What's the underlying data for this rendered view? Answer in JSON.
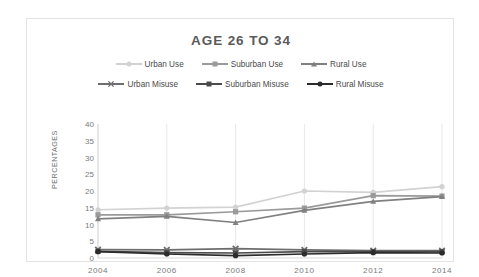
{
  "chart_data": {
    "type": "line",
    "title": "AGE 26 TO 34",
    "xlabel": "",
    "ylabel": "PERCENTAGES",
    "x": [
      2004,
      2006,
      2008,
      2010,
      2012,
      2014
    ],
    "xtick_labels": [
      "2004",
      "2006",
      "2008",
      "2010",
      "2012",
      "2014"
    ],
    "ytick_labels": [
      "0",
      "5",
      "10",
      "15",
      "20",
      "25",
      "30",
      "35",
      "40"
    ],
    "yticks": [
      0,
      5,
      10,
      15,
      20,
      25,
      30,
      35,
      40
    ],
    "ylim": [
      0,
      40
    ],
    "grid": "vertical-only",
    "legend_position": "top-center",
    "series": [
      {
        "name": "Urban Use",
        "color": "#d2d2d2",
        "marker": "circle",
        "values": [
          14.4,
          14.9,
          15.2,
          20.0,
          19.6,
          21.3
        ]
      },
      {
        "name": "Suburban Use",
        "color": "#9a9a9a",
        "marker": "square",
        "values": [
          12.9,
          12.9,
          13.8,
          14.9,
          18.6,
          18.5
        ]
      },
      {
        "name": "Rural Use",
        "color": "#808080",
        "marker": "triangle",
        "values": [
          11.7,
          12.4,
          10.6,
          14.2,
          16.9,
          18.3
        ]
      },
      {
        "name": "Urban Misuse",
        "color": "#6e6e6e",
        "marker": "x",
        "values": [
          2.5,
          2.4,
          2.8,
          2.4,
          2.2,
          2.2
        ]
      },
      {
        "name": "Suburban Misuse",
        "color": "#4a4a4a",
        "marker": "square",
        "values": [
          2.0,
          1.6,
          1.5,
          1.9,
          1.9,
          1.9
        ]
      },
      {
        "name": "Rural Misuse",
        "color": "#2b2b2b",
        "marker": "circle",
        "values": [
          1.9,
          1.2,
          0.7,
          1.2,
          1.6,
          1.5
        ]
      }
    ]
  },
  "legend": {
    "rows": [
      [
        "Urban Use",
        "Suburban Use",
        "Rural Use"
      ],
      [
        "Urban Misuse",
        "Suburban Misuse",
        "Rural Misuse"
      ]
    ]
  },
  "colors": {
    "frame_border": "#e3e3e3",
    "gridline": "#e8e8e8",
    "axis_line": "#d9d9d9",
    "title_text": "#5a5a5a",
    "tick_text": "#7a7a7a"
  }
}
